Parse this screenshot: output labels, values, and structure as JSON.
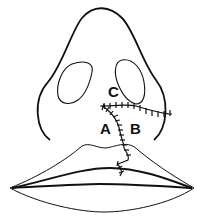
{
  "diagram": {
    "type": "surgical illustration",
    "labels": {
      "a": "A",
      "b": "B",
      "c": "C"
    },
    "parts": [
      "nose-outline",
      "left-nostril",
      "right-nostril",
      "upper-lip",
      "lower-lip",
      "suture-lines"
    ],
    "colors": {
      "stroke": "#111111",
      "background": "#ffffff"
    }
  }
}
